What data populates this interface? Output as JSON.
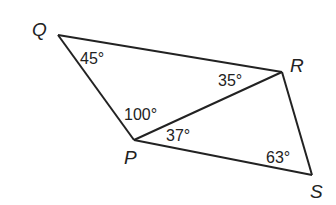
{
  "diagram": {
    "type": "geometry",
    "vertices": {
      "Q": {
        "label": "Q"
      },
      "R": {
        "label": "R"
      },
      "P": {
        "label": "P"
      },
      "S": {
        "label": "S"
      }
    },
    "segments": [
      "QR",
      "QP",
      "PR",
      "PS",
      "RS"
    ],
    "angles": {
      "Q": "45°",
      "QRP": "35°",
      "QPR": "100°",
      "RPS": "37°",
      "S": "63°"
    }
  }
}
